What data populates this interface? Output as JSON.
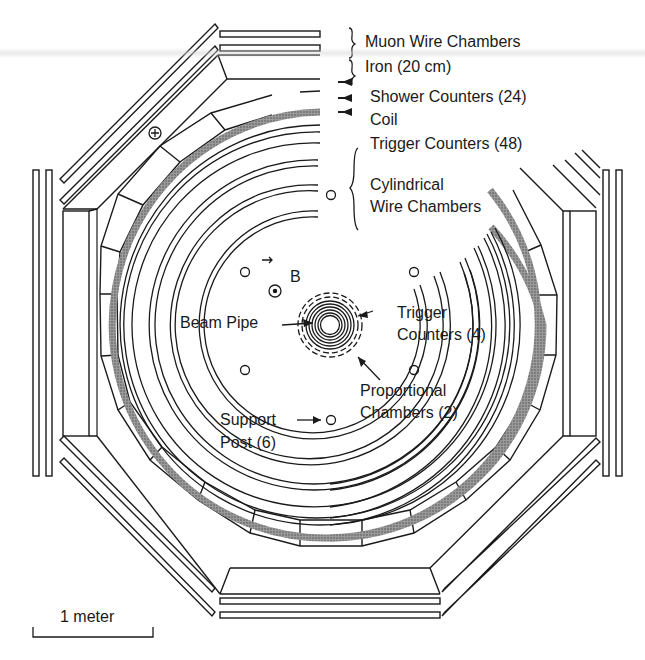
{
  "figure": {
    "center": [
      330,
      325
    ]
  },
  "labels": {
    "muon_wire_chambers": "Muon Wire Chambers",
    "iron": "Iron  (20 cm)",
    "shower_counters": "Shower Counters (24)",
    "coil": "Coil",
    "trigger_counters_outer": "Trigger Counters (48)",
    "cylindrical_1": "Cylindrical",
    "cylindrical_2": "Wire Chambers",
    "b_field": "B",
    "beam_pipe": "Beam Pipe",
    "trigger_inner_1": "Trigger",
    "trigger_inner_2": "Counters (4)",
    "proportional_1": "Proportional",
    "proportional_2": "Chambers (2)",
    "support_1": "Support",
    "support_2": "Post  (6)",
    "scale": "1 meter"
  },
  "colors": {
    "ink": "#1a1a1a",
    "coil": "#8a8a8a",
    "background": "#ffffff"
  }
}
